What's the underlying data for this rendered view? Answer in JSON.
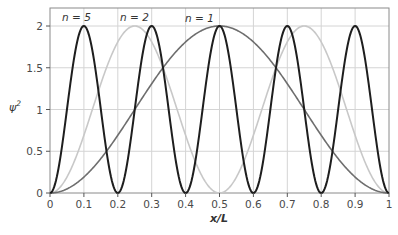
{
  "chart_data": {
    "type": "line",
    "title": "",
    "xlabel": "x/L",
    "ylabel": "ψ²",
    "xlim": [
      0,
      1
    ],
    "ylim": [
      0,
      2.2
    ],
    "grid": true,
    "x_ticks": [
      "0",
      "0.1",
      "0.2",
      "0.3",
      "0.4",
      "0.5",
      "0.6",
      "0.7",
      "0.8",
      "0.9",
      "1"
    ],
    "y_ticks": [
      "0",
      "0.5",
      "1",
      "1.5",
      "2"
    ],
    "function": "psi^2 = 2 sin^2(n*pi*x/L)",
    "series": [
      {
        "name": "n = 1",
        "n": 1,
        "color": "#6e6e6e",
        "peaks_x": [
          0.5
        ],
        "zeros_x": [
          0,
          1
        ],
        "x": [
          0,
          0.1,
          0.2,
          0.3,
          0.4,
          0.5,
          0.6,
          0.7,
          0.8,
          0.9,
          1
        ],
        "values": [
          0,
          0.19,
          0.69,
          1.31,
          1.81,
          2,
          1.81,
          1.31,
          0.69,
          0.19,
          0
        ]
      },
      {
        "name": "n = 2",
        "n": 2,
        "color": "#c8c8c8",
        "peaks_x": [
          0.25,
          0.75
        ],
        "zeros_x": [
          0,
          0.5,
          1
        ],
        "x": [
          0,
          0.1,
          0.2,
          0.25,
          0.3,
          0.4,
          0.5,
          0.6,
          0.7,
          0.75,
          0.8,
          0.9,
          1
        ],
        "values": [
          0,
          0.69,
          1.81,
          2,
          1.81,
          0.69,
          0,
          0.69,
          1.81,
          2,
          1.81,
          0.69,
          0
        ]
      },
      {
        "name": "n = 5",
        "n": 5,
        "color": "#1e1e1e",
        "peaks_x": [
          0.1,
          0.3,
          0.5,
          0.7,
          0.9
        ],
        "zeros_x": [
          0,
          0.2,
          0.4,
          0.6,
          0.8,
          1
        ],
        "x": [
          0,
          0.1,
          0.2,
          0.3,
          0.4,
          0.5,
          0.6,
          0.7,
          0.8,
          0.9,
          1
        ],
        "values": [
          0,
          2,
          0,
          2,
          0,
          2,
          0,
          2,
          0,
          2,
          0
        ]
      }
    ],
    "annotations": [
      {
        "text": "n = 5",
        "x": 0.035,
        "y": 2.1
      },
      {
        "text": "n = 2",
        "x": 0.215,
        "y": 2.1
      },
      {
        "text": "n = 1",
        "x": 0.41,
        "y": 2.08
      }
    ]
  },
  "labels": {
    "n5": "n = 5",
    "n2": "n = 2",
    "n1": "n = 1",
    "xlabel": "x/L",
    "ylabel_base": "ψ",
    "ylabel_sup": "2"
  }
}
